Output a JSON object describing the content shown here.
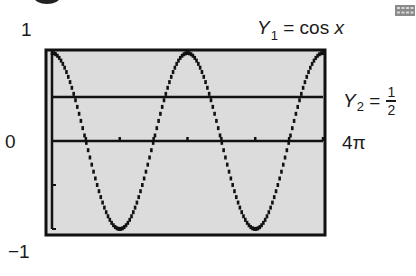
{
  "figure": {
    "cropped_top_mark": "",
    "icon": "calculator-keypad-icon"
  },
  "labels": {
    "y1_name": "Y",
    "y1_sub": "1",
    "y1_rhs": " = cos ",
    "y1_var": "x",
    "y2_name": "Y",
    "y2_sub": "2",
    "y2_eq": " =",
    "y2_num": "1",
    "y2_den": "2",
    "ymax": "1",
    "yzero": "0",
    "ymin": "−1",
    "xmax": "4π"
  },
  "colors": {
    "screen_bg": "#dcdcdc",
    "frame": "#111111",
    "curve": "#111111"
  },
  "chart_data": {
    "type": "line",
    "title": "",
    "xlabel": "",
    "ylabel": "",
    "xlim": [
      0,
      12.566
    ],
    "ylim": [
      -1,
      1
    ],
    "x_tick_step": "π/2",
    "x_ticks_count": 8,
    "grid": false,
    "legend": "inline labels at right",
    "series": [
      {
        "name": "Y1 = cos x",
        "expression": "cos(x)",
        "x": [
          0,
          1.5708,
          3.1416,
          4.7124,
          6.2832,
          7.854,
          9.4248,
          10.9956,
          12.5664
        ],
        "values": [
          1,
          0,
          -1,
          0,
          1,
          0,
          -1,
          0,
          1
        ]
      },
      {
        "name": "Y2 = 1/2",
        "expression": "0.5",
        "x": [
          0,
          12.5664
        ],
        "values": [
          0.5,
          0.5
        ]
      }
    ],
    "annotations": [
      "1",
      "0",
      "−1",
      "4π",
      "Y1 = cos x",
      "Y2 = 1/2"
    ]
  }
}
